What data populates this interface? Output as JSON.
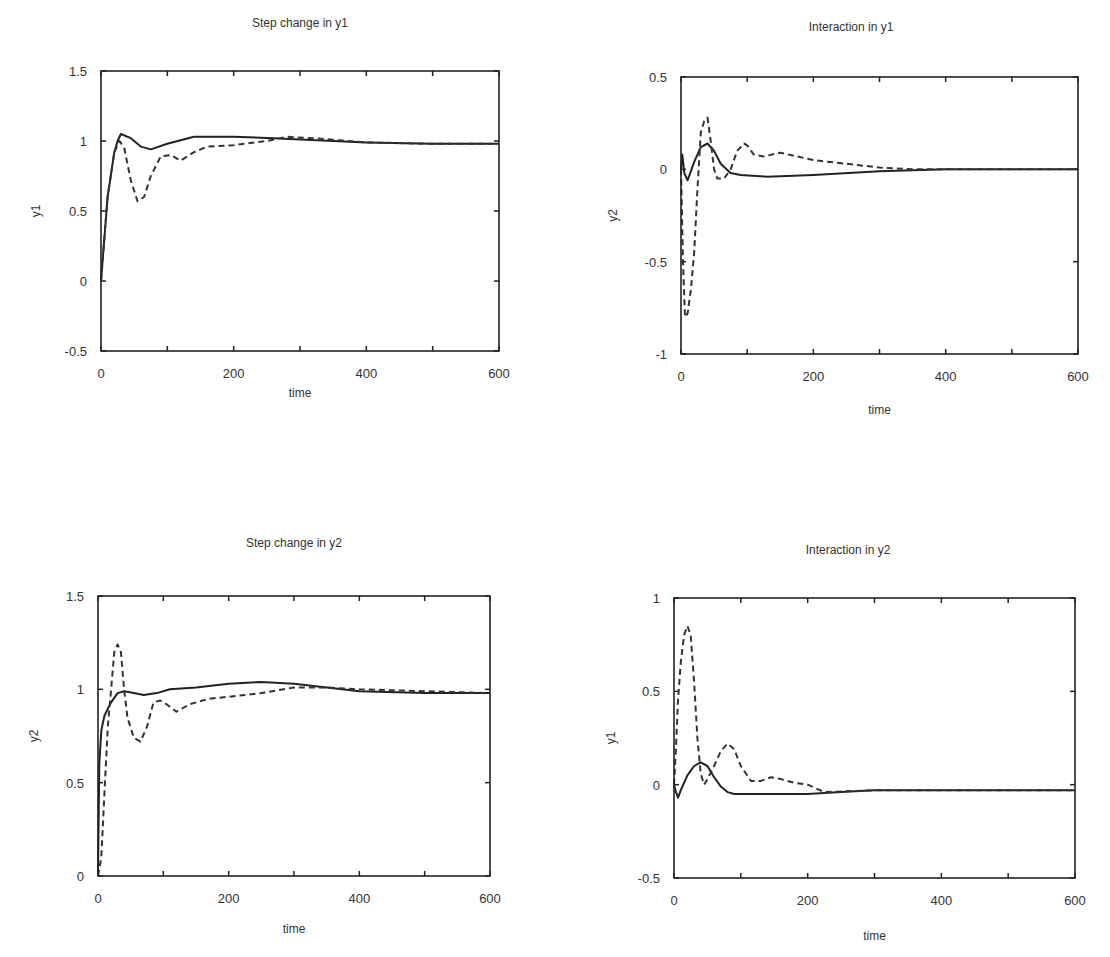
{
  "chart_data": [
    {
      "type": "line",
      "title": "Step change in y1",
      "xlabel": "time",
      "ylabel": "y1",
      "xlim": [
        0,
        600
      ],
      "ylim": [
        -0.5,
        1.5
      ],
      "xticks": [
        0,
        200,
        400,
        600
      ],
      "yticks": [
        -0.5,
        0,
        0.5,
        1,
        1.5
      ],
      "ytick_labels": [
        "-0.5",
        "0",
        "0.5",
        "1",
        "1.5"
      ],
      "grid": false,
      "legend": null,
      "series": [
        {
          "name": "solid",
          "style": "solid",
          "x": [
            0,
            10,
            20,
            25,
            30,
            45,
            60,
            75,
            100,
            140,
            200,
            260,
            300,
            400,
            500,
            600
          ],
          "y": [
            0,
            0.6,
            0.92,
            1.0,
            1.05,
            1.02,
            0.96,
            0.94,
            0.98,
            1.03,
            1.03,
            1.02,
            1.01,
            0.99,
            0.98,
            0.98
          ]
        },
        {
          "name": "dashed",
          "style": "dashed",
          "x": [
            0,
            10,
            20,
            28,
            35,
            45,
            55,
            65,
            75,
            90,
            105,
            120,
            140,
            160,
            200,
            250,
            280,
            320,
            400,
            500,
            600
          ],
          "y": [
            0,
            0.6,
            0.92,
            1.0,
            0.95,
            0.72,
            0.57,
            0.6,
            0.75,
            0.89,
            0.9,
            0.86,
            0.92,
            0.96,
            0.97,
            1.0,
            1.03,
            1.02,
            0.99,
            0.98,
            0.98
          ]
        }
      ]
    },
    {
      "type": "line",
      "title": "Interaction in y1",
      "xlabel": "time",
      "ylabel": "y2",
      "xlim": [
        0,
        600
      ],
      "ylim": [
        -1,
        0.5
      ],
      "xticks": [
        0,
        200,
        400,
        600
      ],
      "yticks": [
        -1,
        -0.5,
        0,
        0.5
      ],
      "ytick_labels": [
        "-1",
        "-0.5",
        "0",
        "0.5"
      ],
      "grid": false,
      "legend": null,
      "series": [
        {
          "name": "solid",
          "style": "solid",
          "x": [
            0,
            2,
            5,
            10,
            20,
            30,
            40,
            50,
            60,
            75,
            90,
            130,
            200,
            300,
            400,
            500,
            600
          ],
          "y": [
            0,
            0.08,
            -0.02,
            -0.06,
            0.04,
            0.12,
            0.14,
            0.1,
            0.03,
            -0.02,
            -0.03,
            -0.04,
            -0.03,
            -0.01,
            0,
            0,
            0
          ]
        },
        {
          "name": "dashed",
          "style": "dashed",
          "x": [
            0,
            3,
            6,
            10,
            15,
            20,
            25,
            30,
            35,
            40,
            45,
            50,
            55,
            65,
            75,
            85,
            95,
            100,
            110,
            125,
            150,
            175,
            200,
            250,
            300,
            350,
            400,
            500,
            600
          ],
          "y": [
            0,
            -0.5,
            -0.8,
            -0.78,
            -0.65,
            -0.45,
            -0.1,
            0.2,
            0.26,
            0.28,
            0.15,
            0.0,
            -0.05,
            -0.05,
            0.0,
            0.1,
            0.14,
            0.13,
            0.08,
            0.07,
            0.09,
            0.07,
            0.05,
            0.03,
            0.01,
            0.0,
            0.0,
            0.0,
            0.0
          ]
        }
      ]
    },
    {
      "type": "line",
      "title": "Step change in y2",
      "xlabel": "time",
      "ylabel": "y2",
      "xlim": [
        0,
        600
      ],
      "ylim": [
        0,
        1.5
      ],
      "xticks": [
        0,
        200,
        400,
        600
      ],
      "yticks": [
        0,
        0.5,
        1,
        1.5
      ],
      "ytick_labels": [
        "0",
        "0.5",
        "1",
        "1.5"
      ],
      "grid": false,
      "legend": null,
      "series": [
        {
          "name": "solid",
          "style": "solid",
          "x": [
            0,
            2,
            5,
            10,
            20,
            30,
            40,
            55,
            70,
            90,
            110,
            150,
            200,
            250,
            300,
            350,
            400,
            500,
            600
          ],
          "y": [
            0,
            0.6,
            0.78,
            0.86,
            0.93,
            0.98,
            0.99,
            0.98,
            0.97,
            0.98,
            1.0,
            1.01,
            1.03,
            1.04,
            1.03,
            1.01,
            0.99,
            0.98,
            0.98
          ]
        },
        {
          "name": "dashed",
          "style": "dashed",
          "x": [
            0,
            5,
            10,
            15,
            20,
            25,
            30,
            35,
            40,
            45,
            55,
            65,
            75,
            85,
            95,
            105,
            120,
            140,
            170,
            200,
            250,
            300,
            350,
            400,
            500,
            600
          ],
          "y": [
            0,
            0.1,
            0.45,
            0.8,
            1.0,
            1.2,
            1.24,
            1.2,
            1.0,
            0.85,
            0.74,
            0.72,
            0.8,
            0.93,
            0.94,
            0.92,
            0.88,
            0.92,
            0.95,
            0.96,
            0.98,
            1.01,
            1.01,
            1.0,
            0.99,
            0.98
          ]
        }
      ]
    },
    {
      "type": "line",
      "title": "Interaction in y2",
      "xlabel": "time",
      "ylabel": "y1",
      "xlim": [
        0,
        600
      ],
      "ylim": [
        -0.5,
        1
      ],
      "xticks": [
        0,
        200,
        400,
        600
      ],
      "yticks": [
        -0.5,
        0,
        0.5,
        1
      ],
      "ytick_labels": [
        "-0.5",
        "0",
        "0.5",
        "1"
      ],
      "grid": false,
      "legend": null,
      "series": [
        {
          "name": "solid",
          "style": "solid",
          "x": [
            0,
            3,
            6,
            10,
            20,
            30,
            40,
            50,
            60,
            70,
            80,
            90,
            120,
            200,
            250,
            300,
            400,
            500,
            600
          ],
          "y": [
            0,
            -0.04,
            -0.07,
            -0.03,
            0.05,
            0.1,
            0.12,
            0.1,
            0.04,
            -0.01,
            -0.04,
            -0.05,
            -0.05,
            -0.05,
            -0.04,
            -0.03,
            -0.03,
            -0.03,
            -0.03
          ]
        },
        {
          "name": "dashed",
          "style": "dashed",
          "x": [
            0,
            3,
            6,
            10,
            15,
            20,
            25,
            30,
            35,
            40,
            45,
            50,
            60,
            70,
            80,
            90,
            100,
            115,
            130,
            145,
            160,
            180,
            200,
            225,
            300,
            400,
            500,
            600
          ],
          "y": [
            0,
            0.2,
            0.45,
            0.65,
            0.8,
            0.85,
            0.8,
            0.55,
            0.25,
            0.06,
            0.0,
            0.03,
            0.1,
            0.18,
            0.22,
            0.19,
            0.1,
            0.02,
            0.02,
            0.04,
            0.03,
            0.01,
            0.0,
            -0.04,
            -0.03,
            -0.03,
            -0.03,
            -0.03
          ]
        }
      ]
    }
  ],
  "panels": [
    {
      "title": "Step change in y1",
      "xlabel": "time",
      "ylabel": "y1"
    },
    {
      "title": "Interaction in y1",
      "xlabel": "time",
      "ylabel": "y2"
    },
    {
      "title": "Step change in y2",
      "xlabel": "time",
      "ylabel": "y2"
    },
    {
      "title": "Interaction in y2",
      "xlabel": "time",
      "ylabel": "y1"
    }
  ]
}
